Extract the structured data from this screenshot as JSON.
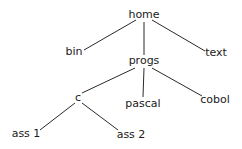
{
  "diagram": {
    "type": "directory-tree",
    "nodes": {
      "home": {
        "label": "home",
        "x": 144,
        "y": 15
      },
      "bin": {
        "label": "bin",
        "x": 74,
        "y": 52
      },
      "text": {
        "label": "text",
        "x": 216,
        "y": 53
      },
      "progs": {
        "label": "progs",
        "x": 144,
        "y": 61
      },
      "c": {
        "label": "c",
        "x": 78,
        "y": 98
      },
      "pascal": {
        "label": "pascal",
        "x": 143,
        "y": 104
      },
      "cobol": {
        "label": "cobol",
        "x": 215,
        "y": 100
      },
      "ass1": {
        "label": "ass 1",
        "x": 26,
        "y": 134
      },
      "ass2": {
        "label": "ass 2",
        "x": 131,
        "y": 135
      }
    },
    "edges": [
      {
        "from": "home",
        "to": "bin",
        "x1": 136,
        "y1": 20,
        "x2": 84,
        "y2": 50
      },
      {
        "from": "home",
        "to": "progs",
        "x1": 144,
        "y1": 22,
        "x2": 144,
        "y2": 55
      },
      {
        "from": "home",
        "to": "text",
        "x1": 152,
        "y1": 20,
        "x2": 205,
        "y2": 51
      },
      {
        "from": "progs",
        "to": "c",
        "x1": 135,
        "y1": 68,
        "x2": 82,
        "y2": 93
      },
      {
        "from": "progs",
        "to": "pascal",
        "x1": 144,
        "y1": 68,
        "x2": 143,
        "y2": 97
      },
      {
        "from": "progs",
        "to": "cobol",
        "x1": 152,
        "y1": 68,
        "x2": 202,
        "y2": 96
      },
      {
        "from": "c",
        "to": "ass1",
        "x1": 75,
        "y1": 103,
        "x2": 40,
        "y2": 130
      },
      {
        "from": "c",
        "to": "ass2",
        "x1": 82,
        "y1": 103,
        "x2": 118,
        "y2": 130
      }
    ]
  }
}
